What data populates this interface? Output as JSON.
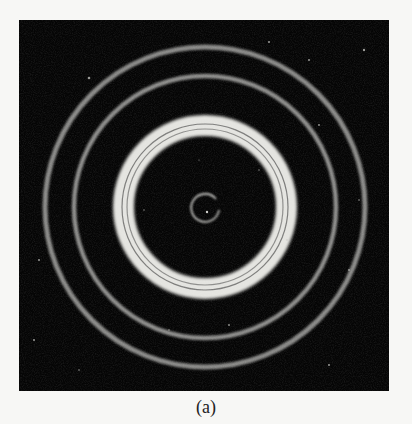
{
  "figure": {
    "background_color": "#050505",
    "center": {
      "x": 186,
      "y": 187
    },
    "rings": [
      {
        "name": "outer-ring",
        "radius": 160,
        "width": 5,
        "color": "#8a8a88"
      },
      {
        "name": "second-ring",
        "radius": 131,
        "width": 4.5,
        "color": "#8e8e8c"
      },
      {
        "name": "bright-ring",
        "outer_radius": 92,
        "inner_radius": 71,
        "color": "#e4e4e0"
      },
      {
        "name": "bright-ring-dark-line-1",
        "radius": 83,
        "width": 1.2,
        "color": "#6a6a68"
      },
      {
        "name": "bright-ring-dark-line-2",
        "radius": 78,
        "width": 1.2,
        "color": "#6a6a68"
      },
      {
        "name": "center-ring",
        "radius": 14,
        "width": 1.6,
        "color": "#d8d8d4"
      }
    ]
  },
  "caption": "(a)"
}
